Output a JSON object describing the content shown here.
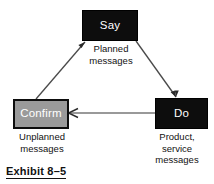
{
  "figure": {
    "caption": "Exhibit 8–5",
    "nodes": [
      {
        "id": "say",
        "label": "Say",
        "sublabel": "Planned\nmessages",
        "fill": "#0d0d0d",
        "text_color": "#ffffff"
      },
      {
        "id": "do",
        "label": "Do",
        "sublabel": "Product,\nservice\nmessages",
        "fill": "#0d0d0d",
        "text_color": "#ffffff"
      },
      {
        "id": "confirm",
        "label": "Confirm",
        "sublabel": "Unplanned\nmessages",
        "fill": "#9a9a9a",
        "text_color": "#ffffff"
      }
    ],
    "edges": [
      {
        "id": "say-to-do",
        "from": "say",
        "to": "do",
        "label": ""
      },
      {
        "id": "do-to-confirm",
        "from": "do",
        "to": "confirm",
        "label": ""
      },
      {
        "id": "confirm-to-say",
        "from": "confirm",
        "to": "say",
        "label": ""
      }
    ],
    "colors": {
      "line": "#4a4a4a",
      "dark_fill": "#0d0d0d",
      "gray_fill": "#9a9a9a",
      "background": "#ffffff",
      "text": "#111111"
    }
  }
}
